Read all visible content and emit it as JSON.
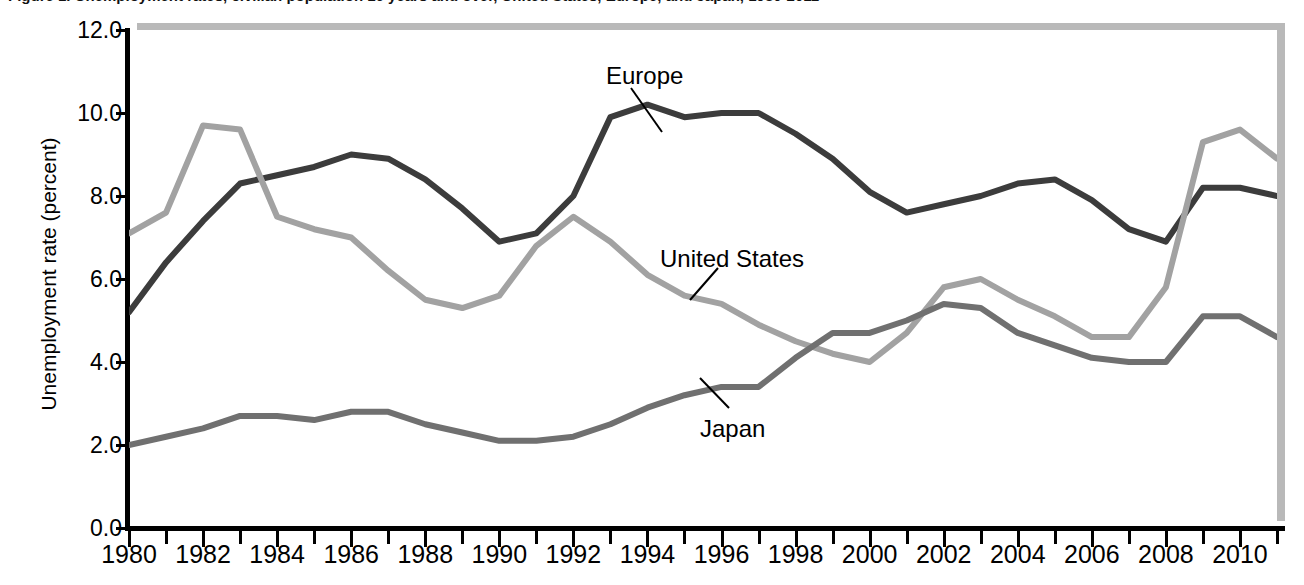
{
  "figure": {
    "title": "Figure 1. Unemployment rates, civilian population 16 years and over, United States, Europe, and Japan, 1980-2011",
    "ylabel": "Unemployment rate (percent)",
    "xlabel": ""
  },
  "axis": {
    "y_ticks": [
      "0.0",
      "2.0",
      "4.0",
      "6.0",
      "8.0",
      "10.0",
      "12.0"
    ],
    "x_ticks": [
      "1980",
      "1982",
      "1984",
      "1986",
      "1988",
      "1990",
      "1992",
      "1994",
      "1996",
      "1998",
      "2000",
      "2002",
      "2004",
      "2006",
      "2008",
      "2010"
    ]
  },
  "annotations": [
    {
      "label": "Europe",
      "x": 606,
      "y": 62
    },
    {
      "label": "United States",
      "x": 660,
      "y": 245
    },
    {
      "label": "Japan",
      "x": 700,
      "y": 415
    }
  ],
  "colors": {
    "europe": "#3c3c3c",
    "united_states": "#a2a2a2",
    "japan": "#707070",
    "axis": "#000000",
    "shadow": "#b9b9b9",
    "background": "#ffffff"
  },
  "chart_data": {
    "type": "line",
    "title": "Figure 1. Unemployment rates, civilian population 16 years and over, United States, Europe, and Japan, 1980-2011",
    "xlabel": "",
    "ylabel": "Unemployment rate (percent)",
    "xlim": [
      1980,
      2011
    ],
    "ylim": [
      0.0,
      12.0
    ],
    "ytick_step": 2.0,
    "xtick_step": 2,
    "xtick_minor_step": 1,
    "grid": false,
    "legend": "inline-annotations",
    "x": [
      1980,
      1981,
      1982,
      1983,
      1984,
      1985,
      1986,
      1987,
      1988,
      1989,
      1990,
      1991,
      1992,
      1993,
      1994,
      1995,
      1996,
      1997,
      1998,
      1999,
      2000,
      2001,
      2002,
      2003,
      2004,
      2005,
      2006,
      2007,
      2008,
      2009,
      2010,
      2011
    ],
    "series": [
      {
        "name": "Europe",
        "color": "#3c3c3c",
        "values": [
          5.2,
          6.4,
          7.4,
          8.3,
          8.5,
          8.7,
          9.0,
          8.9,
          8.4,
          7.7,
          6.9,
          7.1,
          8.0,
          9.9,
          10.2,
          9.9,
          10.0,
          10.0,
          9.5,
          8.9,
          8.1,
          7.6,
          7.8,
          8.0,
          8.3,
          8.4,
          7.9,
          7.2,
          6.9,
          8.2,
          8.2,
          8.0
        ]
      },
      {
        "name": "United States",
        "color": "#a2a2a2",
        "values": [
          7.1,
          7.6,
          9.7,
          9.6,
          7.5,
          7.2,
          7.0,
          6.2,
          5.5,
          5.3,
          5.6,
          6.8,
          7.5,
          6.9,
          6.1,
          5.6,
          5.4,
          4.9,
          4.5,
          4.2,
          4.0,
          4.7,
          5.8,
          6.0,
          5.5,
          5.1,
          4.6,
          4.6,
          5.8,
          9.3,
          9.6,
          8.9
        ]
      },
      {
        "name": "Japan",
        "color": "#707070",
        "values": [
          2.0,
          2.2,
          2.4,
          2.7,
          2.7,
          2.6,
          2.8,
          2.8,
          2.5,
          2.3,
          2.1,
          2.1,
          2.2,
          2.5,
          2.9,
          3.2,
          3.4,
          3.4,
          4.1,
          4.7,
          4.7,
          5.0,
          5.4,
          5.3,
          4.7,
          4.4,
          4.1,
          4.0,
          4.0,
          5.1,
          5.1,
          4.6
        ]
      }
    ]
  }
}
